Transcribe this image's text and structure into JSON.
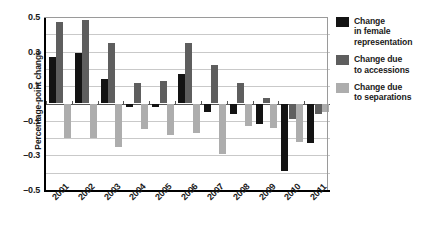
{
  "chart_data": {
    "type": "bar",
    "title": "",
    "subtitle": "",
    "xlabel": "",
    "ylabel": "Percentage-point change",
    "categories": [
      "2001",
      "2002",
      "2003",
      "2004",
      "2005",
      "2006",
      "2007",
      "2008",
      "2009",
      "2010",
      "2011"
    ],
    "series": [
      {
        "name": "Change in female representation",
        "color": "#131313",
        "values": [
          0.27,
          0.29,
          0.14,
          -0.02,
          -0.02,
          0.17,
          -0.05,
          -0.06,
          -0.12,
          -0.39,
          -0.23
        ]
      },
      {
        "name": "Change due to accessions",
        "color": "#5e5e5e",
        "values": [
          0.47,
          0.48,
          0.35,
          0.12,
          0.13,
          0.35,
          0.22,
          0.12,
          0.03,
          -0.09,
          -0.06
        ]
      },
      {
        "name": "Change due to separations",
        "color": "#adadad",
        "values": [
          -0.2,
          -0.2,
          -0.25,
          -0.15,
          -0.18,
          -0.17,
          -0.29,
          -0.13,
          -0.14,
          -0.22,
          -0.05
        ]
      }
    ],
    "ylim": [
      -0.5,
      0.5
    ],
    "yticks": [
      0.5,
      0.3,
      0.1,
      -0.1,
      -0.3,
      -0.5
    ],
    "ytick_labels": [
      "0.5",
      "0.3",
      "0.1",
      "–0.1",
      "–0.3",
      "–0.5"
    ],
    "gridlines": [
      0.4,
      0.3,
      0.2,
      0.1,
      -0.1,
      -0.2,
      -0.3,
      -0.4
    ],
    "grid": true,
    "legend_position": "right",
    "legend_entries": [
      {
        "label_lines": [
          "Change",
          "in female",
          "representation"
        ],
        "color": "#131313"
      },
      {
        "label_lines": [
          "Change due",
          "to accessions"
        ],
        "color": "#5e5e5e"
      },
      {
        "label_lines": [
          "Change due",
          "to separations"
        ],
        "color": "#adadad"
      }
    ]
  },
  "axis": {
    "y_title": "Percentage-point change"
  },
  "legend": {
    "entry0": {
      "line0": "Change",
      "line1": "in female",
      "line2": "representation"
    },
    "entry1": {
      "line0": "Change due",
      "line1": "to accessions"
    },
    "entry2": {
      "line0": "Change due",
      "line1": "to separations"
    }
  }
}
